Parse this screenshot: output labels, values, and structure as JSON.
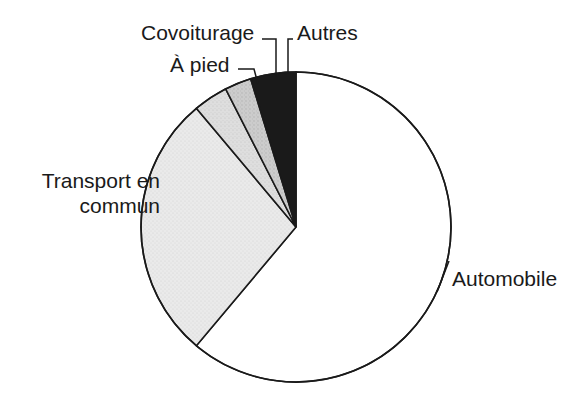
{
  "chart_data": {
    "type": "pie",
    "title": "",
    "subtitle": "",
    "xlabel": "",
    "ylabel": "",
    "legend_position": "none",
    "grid": false,
    "labels_inline": true,
    "center": {
      "x": 296,
      "y": 227
    },
    "radius": 155,
    "start_angle_deg": 0,
    "direction": "clockwise",
    "categories": [
      "Automobile",
      "Transport en commun",
      "À pied",
      "Covoiturage",
      "Autres"
    ],
    "values": [
      61.1,
      27.8,
      3.6,
      2.8,
      4.7
    ],
    "slices": [
      {
        "label": "Automobile",
        "value": 61.1,
        "sweep_deg": 220,
        "start_deg": 0,
        "end_deg": 220,
        "fill": "#ffffff",
        "stroke": "#1a1a1a"
      },
      {
        "label": "Transport en commun",
        "value": 27.8,
        "sweep_deg": 100,
        "start_deg": 220,
        "end_deg": 320,
        "fill": "#e9e9e9",
        "stroke": "#1a1a1a"
      },
      {
        "label": "À pied",
        "value": 3.6,
        "sweep_deg": 13,
        "start_deg": 320,
        "end_deg": 333,
        "fill": "#d8d8d8",
        "stroke": "#1a1a1a"
      },
      {
        "label": "Covoiturage",
        "value": 2.8,
        "sweep_deg": 10,
        "start_deg": 333,
        "end_deg": 343,
        "fill": "#c4c4c4",
        "stroke": "#1a1a1a"
      },
      {
        "label": "Autres",
        "value": 4.7,
        "sweep_deg": 17,
        "start_deg": 343,
        "end_deg": 360,
        "fill": "#1a1a1a",
        "stroke": "#1a1a1a"
      }
    ]
  },
  "labels": {
    "covoiturage": "Covoiturage",
    "a_pied": "À pied",
    "autres": "Autres",
    "transport_en_commun": "Transport en commun",
    "automobile": "Automobile"
  },
  "colors": {
    "outline": "#1a1a1a",
    "text": "#1a1a1a",
    "background": "#ffffff",
    "slice_automobile": "#ffffff",
    "slice_transport": "#e9e9e9",
    "slice_a_pied": "#d8d8d8",
    "slice_covoiturage": "#c4c4c4",
    "slice_autres": "#1a1a1a"
  }
}
